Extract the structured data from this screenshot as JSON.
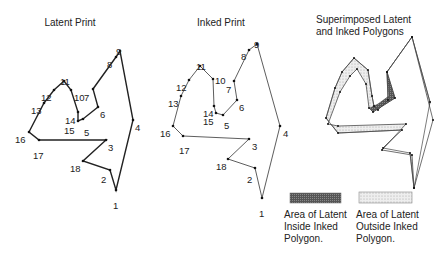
{
  "titles": {
    "latent": "Latent Print",
    "inked": "Inked Print",
    "superimposed_line1": "Superimposed Latent",
    "superimposed_line2": "and Inked Polygons"
  },
  "legend": {
    "inside": "Area of Latent\nInside Inked\nPolygon.",
    "outside": "Area of Latent\nOutside Inked\nPolygon."
  },
  "colors": {
    "line": "#222222",
    "dark_fill": "#555555",
    "light_fill": "#e4e4e4"
  },
  "latent_points": [
    {
      "n": "1",
      "x": 116,
      "y": 190,
      "lx": 113,
      "ly": 201
    },
    {
      "n": "2",
      "x": 110,
      "y": 170,
      "lx": 101,
      "ly": 175
    },
    {
      "n": "3",
      "x": 106,
      "y": 140,
      "lx": 108,
      "ly": 143
    },
    {
      "n": "4",
      "x": 133,
      "y": 120,
      "lx": 135,
      "ly": 123
    },
    {
      "n": "5",
      "x": 83,
      "y": 119,
      "lx": 84,
      "ly": 128
    },
    {
      "n": "6",
      "x": 98,
      "y": 107,
      "lx": 100,
      "ly": 110
    },
    {
      "n": "7",
      "x": 93,
      "y": 89,
      "lx": 84,
      "ly": 93
    },
    {
      "n": "8",
      "x": 116,
      "y": 57,
      "lx": 107,
      "ly": 60
    },
    {
      "n": "9",
      "x": 120,
      "y": 51,
      "lx": 116,
      "ly": 47
    },
    {
      "n": "10",
      "x": 71,
      "y": 90,
      "lx": 74,
      "ly": 93
    },
    {
      "n": "11",
      "x": 64,
      "y": 81,
      "lx": 60,
      "ly": 77
    },
    {
      "n": "12",
      "x": 54,
      "y": 90,
      "lx": 41,
      "ly": 93
    },
    {
      "n": "13",
      "x": 44,
      "y": 103,
      "lx": 31,
      "ly": 106
    },
    {
      "n": "14",
      "x": 78,
      "y": 112,
      "lx": 65,
      "ly": 116
    },
    {
      "n": "15",
      "x": 78,
      "y": 121,
      "lx": 64,
      "ly": 126
    },
    {
      "n": "16",
      "x": 29,
      "y": 132,
      "lx": 15,
      "ly": 135
    },
    {
      "n": "17",
      "x": 39,
      "y": 140,
      "lx": 33,
      "ly": 151
    },
    {
      "n": "18",
      "x": 83,
      "y": 161,
      "lx": 70,
      "ly": 164
    }
  ],
  "inked_points": [
    {
      "n": "1",
      "x": 262,
      "y": 198,
      "lx": 259,
      "ly": 209
    },
    {
      "n": "2",
      "x": 255,
      "y": 168,
      "lx": 247,
      "ly": 175
    },
    {
      "n": "3",
      "x": 249,
      "y": 139,
      "lx": 252,
      "ly": 142
    },
    {
      "n": "4",
      "x": 280,
      "y": 126,
      "lx": 283,
      "ly": 129
    },
    {
      "n": "5",
      "x": 223,
      "y": 115,
      "lx": 224,
      "ly": 121
    },
    {
      "n": "6",
      "x": 237,
      "y": 100,
      "lx": 239,
      "ly": 103
    },
    {
      "n": "7",
      "x": 234,
      "y": 81,
      "lx": 226,
      "ly": 85
    },
    {
      "n": "8",
      "x": 249,
      "y": 50,
      "lx": 241,
      "ly": 52
    },
    {
      "n": "9",
      "x": 257,
      "y": 44,
      "lx": 254,
      "ly": 40
    },
    {
      "n": "10",
      "x": 213,
      "y": 79,
      "lx": 215,
      "ly": 76
    },
    {
      "n": "11",
      "x": 200,
      "y": 66,
      "lx": 196,
      "ly": 62
    },
    {
      "n": "12",
      "x": 189,
      "y": 80,
      "lx": 176,
      "ly": 83
    },
    {
      "n": "13",
      "x": 181,
      "y": 96,
      "lx": 168,
      "ly": 99
    },
    {
      "n": "14",
      "x": 214,
      "y": 106,
      "lx": 203,
      "ly": 109
    },
    {
      "n": "15",
      "x": 216,
      "y": 113,
      "lx": 203,
      "ly": 117
    },
    {
      "n": "16",
      "x": 173,
      "y": 126,
      "lx": 160,
      "ly": 129
    },
    {
      "n": "17",
      "x": 183,
      "y": 136,
      "lx": 179,
      "ly": 146
    },
    {
      "n": "18",
      "x": 228,
      "y": 159,
      "lx": 216,
      "ly": 162
    }
  ],
  "polygon_order": [
    "1",
    "2",
    "18",
    "3",
    "17",
    "16",
    "13",
    "12",
    "11",
    "10",
    "14",
    "15",
    "5",
    "6",
    "7",
    "8",
    "9",
    "4"
  ],
  "superimposed": {
    "latent": [
      [
        414,
        188
      ],
      [
        410,
        153
      ],
      [
        383,
        148
      ],
      [
        402,
        130
      ],
      [
        338,
        133
      ],
      [
        326,
        118
      ],
      [
        335,
        88
      ],
      [
        342,
        72
      ],
      [
        354,
        58
      ],
      [
        368,
        70
      ],
      [
        372,
        96
      ],
      [
        374,
        106
      ],
      [
        378,
        110
      ],
      [
        388,
        100
      ],
      [
        387,
        72
      ],
      [
        412,
        37
      ],
      [
        430,
        102
      ]
    ],
    "inked": [
      [
        414,
        188
      ],
      [
        412,
        155
      ],
      [
        382,
        150
      ],
      [
        406,
        124
      ],
      [
        338,
        126
      ],
      [
        328,
        124
      ],
      [
        340,
        92
      ],
      [
        350,
        76
      ],
      [
        357,
        69
      ],
      [
        366,
        84
      ],
      [
        369,
        108
      ],
      [
        373,
        112
      ],
      [
        395,
        98
      ],
      [
        387,
        72
      ],
      [
        412,
        37
      ],
      [
        433,
        120
      ]
    ]
  }
}
